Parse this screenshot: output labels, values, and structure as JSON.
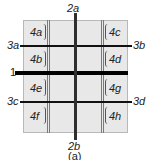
{
  "diagram": {
    "caption": "(a)",
    "line_labels": {
      "main_horizontal": "1",
      "vertical_top": "2a",
      "vertical_bottom": "2b",
      "h_left_upper": "3a",
      "h_right_upper": "3b",
      "h_left_lower": "3c",
      "h_right_lower": "3d"
    },
    "cells": {
      "left": [
        "4a",
        "4b",
        "4e",
        "4f"
      ],
      "right": [
        "4c",
        "4d",
        "4g",
        "4h"
      ]
    },
    "colors": {
      "panel_fill": "#e8e8e8",
      "lines": "#111111"
    }
  }
}
